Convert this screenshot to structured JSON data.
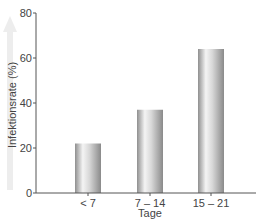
{
  "chart_data": {
    "type": "bar",
    "title": "",
    "xlabel": "Tage",
    "ylabel": "Infektionsrate (%)",
    "categories": [
      "< 7",
      "7 – 14",
      "15 – 21"
    ],
    "values": [
      22,
      37,
      64
    ],
    "ylim": [
      0,
      80
    ],
    "yticks": [
      0,
      20,
      40,
      60,
      80
    ],
    "grid": false,
    "legend": null,
    "bar_color": "#b8b8b8",
    "arrow_color": "#e6e6e6"
  }
}
